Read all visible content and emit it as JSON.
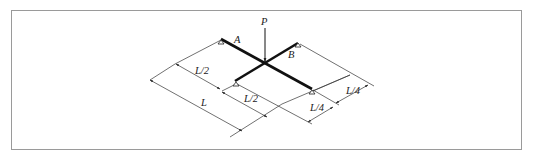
{
  "figure": {
    "type": "structural-diagram",
    "load_label": "P",
    "support_labels": {
      "A": "A",
      "B": "B"
    },
    "dimensions": {
      "left_half_upper": "L/2",
      "left_half_lower": "L/2",
      "total": "L",
      "right_quarter_upper": "L/4",
      "right_quarter_lower": "L/4"
    },
    "colors": {
      "beam": "#111111",
      "line": "#333333",
      "frame": "#9a9a9a"
    }
  }
}
